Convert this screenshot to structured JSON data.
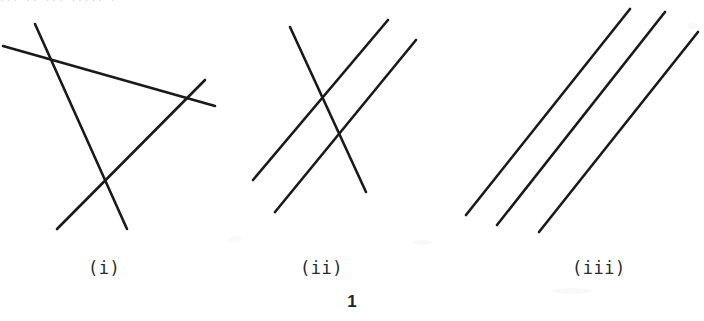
{
  "page": {
    "background_color": "#ffffff",
    "ink_color": "#1a1a1a",
    "page_number": "1",
    "top_cut_text": "··· ·· ···   ·····  ·"
  },
  "figures": [
    {
      "id": "figure-i",
      "caption": "(i)",
      "description": "three lines intersecting pairwise forming a triangle",
      "line_count": 3,
      "lines": [
        {
          "name": "line-a",
          "x1": 3,
          "y1": 46,
          "x2": 215,
          "y2": 106
        },
        {
          "name": "line-b",
          "x1": 35,
          "y1": 24,
          "x2": 127,
          "y2": 229
        },
        {
          "name": "line-c",
          "x1": 57,
          "y1": 229,
          "x2": 205,
          "y2": 80
        }
      ]
    },
    {
      "id": "figure-ii",
      "caption": "(ii)",
      "description": "two parallel lines cut by a transversal, two intersection points",
      "line_count": 3,
      "lines": [
        {
          "name": "line-a",
          "x1": 290,
          "y1": 27,
          "x2": 366,
          "y2": 192
        },
        {
          "name": "line-b",
          "x1": 253,
          "y1": 180,
          "x2": 388,
          "y2": 20
        },
        {
          "name": "line-c",
          "x1": 275,
          "y1": 212,
          "x2": 416,
          "y2": 40
        }
      ]
    },
    {
      "id": "figure-iii",
      "caption": "(iii)",
      "description": "three parallel lines, no intersections",
      "line_count": 3,
      "lines": [
        {
          "name": "line-a",
          "x1": 466,
          "y1": 215,
          "x2": 630,
          "y2": 9
        },
        {
          "name": "line-b",
          "x1": 497,
          "y1": 225,
          "x2": 665,
          "y2": 12
        },
        {
          "name": "line-c",
          "x1": 539,
          "y1": 232,
          "x2": 698,
          "y2": 32
        }
      ]
    }
  ],
  "captions": {
    "i": "(i)",
    "ii": "(ii)",
    "iii": "(iii)"
  }
}
